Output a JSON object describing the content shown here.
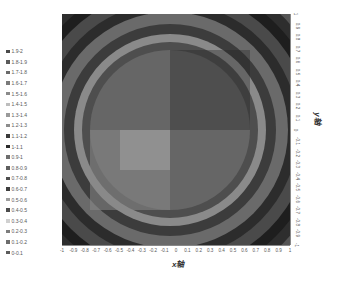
{
  "chart_data": {
    "type": "heatmap",
    "subtype": "contour",
    "title": "",
    "xlabel": "x轴",
    "ylabel": "y轴",
    "x_ticks": [
      "-1",
      "-0.9",
      "-0.8",
      "-0.7",
      "-0.6",
      "-0.5",
      "-0.4",
      "-0.3",
      "-0.2",
      "-0.1",
      "0",
      "0.1",
      "0.2",
      "0.3",
      "0.4",
      "0.5",
      "0.6",
      "0.7",
      "0.8",
      "0.9",
      "1"
    ],
    "y_ticks": [
      "1",
      "0.9",
      "0.8",
      "0.7",
      "0.6",
      "0.5",
      "0.4",
      "0.3",
      "0.2",
      "0.1",
      "0",
      "-0.1",
      "-0.2",
      "-0.3",
      "-0.4",
      "-0.5",
      "-0.6",
      "-0.7",
      "-0.8",
      "-0.9",
      "-1"
    ],
    "xlim": [
      -1,
      1
    ],
    "ylim": [
      -1,
      1
    ],
    "legend_position": "left",
    "legend": [
      "1.9-2",
      "1.8-1.9",
      "1.7-1.8",
      "1.6-1.7",
      "1.5-1.6",
      "1.4-1.5",
      "1.3-1.4",
      "1.2-1.3",
      "1.1-1.2",
      "1-1.1",
      "0.9-1",
      "0.8-0.9",
      "0.7-0.8",
      "0.6-0.7",
      "0.5-0.6",
      "0.4-0.5",
      "0.3-0.4",
      "0.2-0.3",
      "0.1-0.2",
      "0-0.1"
    ],
    "legend_colors": [
      "#4a4a4a",
      "#5a5a5a",
      "#6a6a6a",
      "#7a7a7a",
      "#8a8a8a",
      "#bdbdbd",
      "#9a9a9a",
      "#8c8c8c",
      "#3a3a3a",
      "#2a2a2a",
      "#6e6e6e",
      "#5e5e5e",
      "#4e4e4e",
      "#3e3e3e",
      "#9e9e9e",
      "#4c4c4c",
      "#d0d0d0",
      "#7c7c7c",
      "#6c6c6c",
      "#5c5c5c"
    ]
  }
}
